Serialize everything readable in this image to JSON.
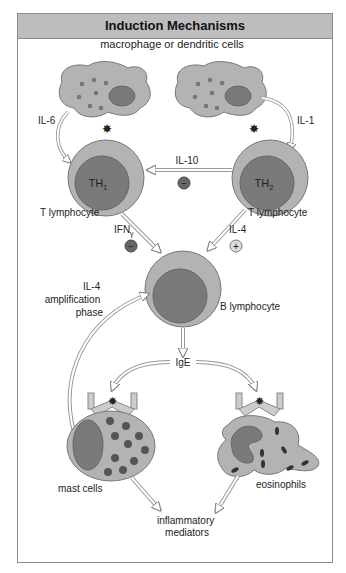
{
  "title": "Induction Mechanisms",
  "labels": {
    "apc": "macrophage or dendritic cells",
    "il6": "IL-6",
    "il1": "IL-1",
    "il10": "IL-10",
    "th1": "TH",
    "th1_sub": "1",
    "th2": "TH",
    "th2_sub": "2",
    "t_lymph_left": "T lymphocyte",
    "t_lymph_right": "T lymphocyte",
    "ifn": "IFN",
    "ifn_sub": "γ",
    "il4": "IL-4",
    "b_lymph": "B lymphocyte",
    "amp_line1": "IL-4",
    "amp_line2": "amplification",
    "amp_line3": "phase",
    "ige": "IgE",
    "mast": "mast cells",
    "eos": "eosinophils",
    "infl_line1": "inflammatory",
    "infl_line2": "mediators"
  },
  "signs": {
    "minus": "−",
    "plus": "+"
  },
  "colors": {
    "cell_fill": "#b3b3b3",
    "nucleus_fill": "#7a7a7a",
    "dark_dot": "#555555",
    "title_bg": "#bdbdbd"
  }
}
